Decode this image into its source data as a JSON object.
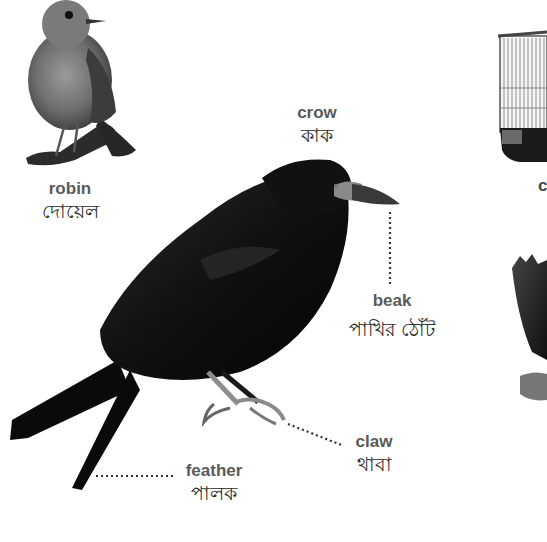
{
  "diagram": {
    "type": "labeled-picture",
    "colors": {
      "background": "#ffffff",
      "label_en": "#5a5a5a",
      "label_bn": "#2a2a2a",
      "leader_line": "#333333",
      "crow": "#0d0d0d"
    },
    "labels": [
      {
        "id": "robin",
        "en": "robin",
        "bn": "দোয়েল"
      },
      {
        "id": "crow",
        "en": "crow",
        "bn": "কাক"
      },
      {
        "id": "beak",
        "en": "beak",
        "bn": "পাখির ঠোঁট"
      },
      {
        "id": "claw",
        "en": "claw",
        "bn": "থাবা"
      },
      {
        "id": "feather",
        "en": "feather",
        "bn": "পালক"
      }
    ],
    "cut_off_right_label": {
      "en": "c",
      "bn": "·"
    },
    "images": [
      "robin",
      "crow",
      "birdcage",
      "eagle"
    ]
  }
}
